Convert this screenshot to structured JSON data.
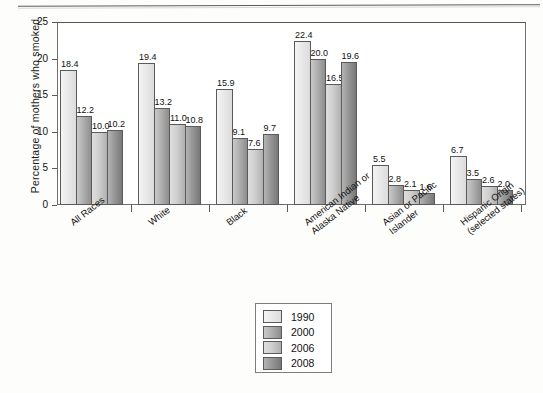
{
  "chart_data": {
    "type": "bar",
    "title": "",
    "subtitle": "",
    "xlabel": "",
    "ylabel": "Percentage of mothers who smoked",
    "ylim": [
      0,
      25
    ],
    "yticks": [
      0,
      5,
      10,
      15,
      20,
      25
    ],
    "ytick_labels": [
      "0",
      "5",
      "10",
      "15",
      "20",
      "25"
    ],
    "grid": false,
    "legend_position": "below-center",
    "categories": [
      "All Races",
      "White",
      "Black",
      "American Indian or\nAlaska Native",
      "Asian or Pacific\nIslander",
      "Hispanic Origin\n(selected states)"
    ],
    "category_lines": [
      [
        "All Races"
      ],
      [
        "White"
      ],
      [
        "Black"
      ],
      [
        "American Indian or",
        "Alaska Native"
      ],
      [
        "Asian or Pacific",
        "Islander"
      ],
      [
        "Hispanic Origin",
        "(selected states)"
      ]
    ],
    "series": [
      {
        "name": "1990",
        "color": "#efefef",
        "values": [
          18.4,
          19.4,
          15.9,
          22.4,
          5.5,
          6.7
        ]
      },
      {
        "name": "2000",
        "color": "#b0b0b0",
        "values": [
          12.2,
          13.2,
          9.1,
          20.0,
          2.8,
          3.5
        ]
      },
      {
        "name": "2006",
        "color": "#cccccc",
        "values": [
          10.0,
          11.0,
          7.6,
          16.5,
          2.1,
          2.6
        ]
      },
      {
        "name": "2008",
        "color": "#949494",
        "values": [
          10.2,
          10.8,
          9.7,
          19.6,
          1.6,
          2.0
        ]
      }
    ],
    "value_labels": [
      [
        "18.4",
        "12.2",
        "10.0",
        "10.2"
      ],
      [
        "19.4",
        "13.2",
        "11.0",
        "10.8"
      ],
      [
        "15.9",
        "9.1",
        "7.6",
        "9.7"
      ],
      [
        "22.4",
        "20.0",
        "16.5",
        "19.6"
      ],
      [
        "5.5",
        "2.8",
        "2.1",
        "1.6"
      ],
      [
        "6.7",
        "3.5",
        "2.6",
        "2.0"
      ]
    ]
  },
  "legend": {
    "items": [
      {
        "label": "1990"
      },
      {
        "label": "2000"
      },
      {
        "label": "2006"
      },
      {
        "label": "2008"
      }
    ]
  }
}
